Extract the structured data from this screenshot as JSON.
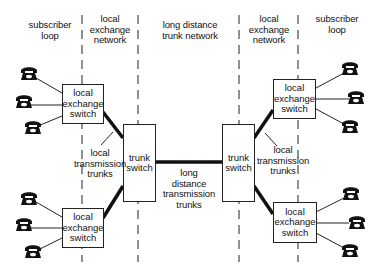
{
  "columns": [
    {
      "id": "left-subscriber-loop",
      "lines": [
        "subscriber",
        "loop"
      ]
    },
    {
      "id": "left-local-exchange-network",
      "lines": [
        "local",
        "exchange",
        "network"
      ]
    },
    {
      "id": "long-distance-trunk-network",
      "lines": [
        "long distance",
        "trunk network"
      ]
    },
    {
      "id": "right-local-exchange-network",
      "lines": [
        "local",
        "exchange",
        "network"
      ]
    },
    {
      "id": "right-subscriber-loop",
      "lines": [
        "subscriber",
        "loop"
      ]
    }
  ],
  "nodes": {
    "left_top_exchange": {
      "lines": [
        "local",
        "exchange",
        "switch"
      ],
      "phones": 3
    },
    "left_bottom_exchange": {
      "lines": [
        "local",
        "exchange",
        "switch"
      ],
      "phones": 3
    },
    "left_trunk": {
      "lines": [
        "trunk",
        "switch"
      ]
    },
    "right_trunk": {
      "lines": [
        "trunk",
        "switch"
      ]
    },
    "right_top_exchange": {
      "lines": [
        "local",
        "exchange",
        "switch"
      ],
      "phones": 3
    },
    "right_bottom_exchange": {
      "lines": [
        "local",
        "exchange",
        "switch"
      ],
      "phones": 3
    }
  },
  "edge_labels": {
    "left_local_trunks": [
      "local",
      "transmission",
      "trunks"
    ],
    "long_distance_trunks": [
      "long",
      "distance",
      "transmission",
      "trunks"
    ],
    "right_local_trunks": [
      "local",
      "transmission",
      "trunks"
    ]
  },
  "icons": {
    "telephone": "telephone-icon"
  },
  "colors": {
    "line": "#111111",
    "background": "#ffffff"
  }
}
